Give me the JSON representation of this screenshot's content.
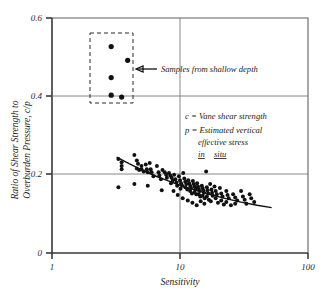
{
  "chart_data": {
    "type": "scatter",
    "title": "",
    "xlabel": "Sensitivity",
    "ylabel": "Ratio of Shear Strength to Overburden Pressure, c/p",
    "xscale": "log",
    "yscale": "linear",
    "xlim": [
      1,
      100
    ],
    "ylim": [
      0,
      0.6
    ],
    "xticks": [
      1,
      10,
      100
    ],
    "xtick_labels": [
      "1",
      "10",
      "100"
    ],
    "yticks": [
      0,
      0.2,
      0.4,
      0.6
    ],
    "ytick_labels": [
      "0",
      "0.2",
      "0.4",
      "0.6"
    ],
    "grid": "gridlines at y=0.2, y=0.4 and x=10",
    "legend": "none",
    "series": [
      {
        "name": "Samples from shallow depth",
        "marker": "filled-circle",
        "points": [
          [
            2.9,
            0.527
          ],
          [
            3.9,
            0.492
          ],
          [
            2.9,
            0.448
          ],
          [
            2.9,
            0.403
          ],
          [
            3.5,
            0.398
          ]
        ]
      },
      {
        "name": "Main data",
        "marker": "filled-circle",
        "points": [
          [
            3.3,
            0.24
          ],
          [
            3.5,
            0.232
          ],
          [
            3.5,
            0.222
          ],
          [
            3.5,
            0.214
          ],
          [
            3.3,
            0.168
          ],
          [
            4.4,
            0.25
          ],
          [
            4.6,
            0.236
          ],
          [
            4.7,
            0.228
          ],
          [
            4.6,
            0.216
          ],
          [
            4.8,
            0.212
          ],
          [
            5.0,
            0.222
          ],
          [
            5.0,
            0.214
          ],
          [
            5.2,
            0.208
          ],
          [
            4.4,
            0.176
          ],
          [
            5.4,
            0.226
          ],
          [
            5.5,
            0.214
          ],
          [
            5.6,
            0.206
          ],
          [
            5.8,
            0.23
          ],
          [
            5.9,
            0.214
          ],
          [
            6.0,
            0.206
          ],
          [
            6.2,
            0.196
          ],
          [
            5.6,
            0.172
          ],
          [
            6.6,
            0.222
          ],
          [
            6.8,
            0.206
          ],
          [
            6.9,
            0.198
          ],
          [
            7.1,
            0.188
          ],
          [
            7.3,
            0.212
          ],
          [
            7.6,
            0.206
          ],
          [
            7.8,
            0.2
          ],
          [
            7.9,
            0.192
          ],
          [
            7.2,
            0.16
          ],
          [
            8.2,
            0.204
          ],
          [
            8.4,
            0.198
          ],
          [
            8.6,
            0.192
          ],
          [
            8.5,
            0.178
          ],
          [
            8.8,
            0.186
          ],
          [
            9.0,
            0.2
          ],
          [
            9.2,
            0.188
          ],
          [
            9.4,
            0.18
          ],
          [
            9.5,
            0.172
          ],
          [
            8.9,
            0.158
          ],
          [
            9.8,
            0.196
          ],
          [
            10.0,
            0.186
          ],
          [
            10.2,
            0.178
          ],
          [
            10.4,
            0.172
          ],
          [
            10.1,
            0.164
          ],
          [
            10.6,
            0.204
          ],
          [
            10.8,
            0.19
          ],
          [
            11.0,
            0.182
          ],
          [
            11.2,
            0.176
          ],
          [
            11.0,
            0.168
          ],
          [
            11.4,
            0.162
          ],
          [
            11.6,
            0.186
          ],
          [
            11.8,
            0.178
          ],
          [
            12.0,
            0.172
          ],
          [
            12.2,
            0.166
          ],
          [
            12.0,
            0.158
          ],
          [
            12.4,
            0.152
          ],
          [
            12.6,
            0.184
          ],
          [
            12.8,
            0.176
          ],
          [
            13.0,
            0.17
          ],
          [
            13.2,
            0.164
          ],
          [
            13.0,
            0.156
          ],
          [
            13.4,
            0.15
          ],
          [
            13.6,
            0.178
          ],
          [
            13.8,
            0.17
          ],
          [
            14.0,
            0.164
          ],
          [
            14.2,
            0.158
          ],
          [
            14.0,
            0.15
          ],
          [
            14.4,
            0.144
          ],
          [
            14.8,
            0.172
          ],
          [
            15.0,
            0.166
          ],
          [
            15.2,
            0.16
          ],
          [
            15.4,
            0.154
          ],
          [
            15.0,
            0.146
          ],
          [
            15.6,
            0.14
          ],
          [
            16.0,
            0.208
          ],
          [
            16.2,
            0.168
          ],
          [
            16.4,
            0.16
          ],
          [
            16.6,
            0.152
          ],
          [
            16.2,
            0.144
          ],
          [
            16.8,
            0.136
          ],
          [
            17.2,
            0.176
          ],
          [
            17.6,
            0.162
          ],
          [
            17.8,
            0.154
          ],
          [
            18.0,
            0.146
          ],
          [
            17.4,
            0.132
          ],
          [
            18.6,
            0.17
          ],
          [
            19.0,
            0.158
          ],
          [
            19.4,
            0.15
          ],
          [
            19.0,
            0.14
          ],
          [
            19.8,
            0.128
          ],
          [
            20.5,
            0.166
          ],
          [
            21.0,
            0.152
          ],
          [
            21.5,
            0.144
          ],
          [
            21.0,
            0.134
          ],
          [
            22.0,
            0.124
          ],
          [
            23.0,
            0.158
          ],
          [
            23.5,
            0.148
          ],
          [
            24.0,
            0.14
          ],
          [
            23.0,
            0.13
          ],
          [
            25.0,
            0.122
          ],
          [
            26.0,
            0.15
          ],
          [
            27.0,
            0.142
          ],
          [
            28.0,
            0.134
          ],
          [
            27.0,
            0.126
          ],
          [
            30.0,
            0.158
          ],
          [
            31.0,
            0.144
          ],
          [
            32.0,
            0.136
          ],
          [
            33.0,
            0.126
          ],
          [
            35.0,
            0.15
          ],
          [
            36.0,
            0.14
          ],
          [
            38.0,
            0.13
          ],
          [
            12.5,
            0.128
          ],
          [
            13.5,
            0.122
          ],
          [
            15.5,
            0.126
          ],
          [
            11.5,
            0.134
          ],
          [
            14.5,
            0.132
          ],
          [
            10.5,
            0.14
          ],
          [
            9.6,
            0.148
          ]
        ]
      }
    ],
    "trend_line": {
      "name": "fitted average curve",
      "points": [
        [
          3.2,
          0.245
        ],
        [
          4.0,
          0.228
        ],
        [
          5.0,
          0.212
        ],
        [
          6.5,
          0.196
        ],
        [
          8.0,
          0.185
        ],
        [
          10.0,
          0.173
        ],
        [
          13.0,
          0.161
        ],
        [
          17.0,
          0.15
        ],
        [
          22.0,
          0.14
        ],
        [
          30.0,
          0.13
        ],
        [
          40.0,
          0.122
        ],
        [
          52.0,
          0.116
        ]
      ]
    },
    "annotations": [
      {
        "name": "shallow-depth-callout",
        "text": "Samples from shallow depth",
        "arrow": "left"
      },
      {
        "name": "symbol-key",
        "lines": [
          "c = Vane shear strength",
          "p = Estimated vertical",
          "effective stress",
          "in  situ"
        ],
        "underlined_last": true
      }
    ],
    "boxes": [
      {
        "name": "shallow-depth-box",
        "style": "dashed",
        "x_range": [
          2.4,
          4.8
        ],
        "y_range": [
          0.383,
          0.548
        ]
      }
    ]
  },
  "axes": {
    "y_title": "Ratio of Shear Strength to",
    "y_title_2": "Overburden Pressure, c/p",
    "x_title": "Sensitivity",
    "y_tick_0": "0",
    "y_tick_02": "0.2",
    "y_tick_04": "0.4",
    "y_tick_06": "0.6",
    "x_tick_1": "1",
    "x_tick_10": "10",
    "x_tick_100": "100"
  },
  "notes": {
    "callout": "Samples from shallow depth",
    "key_c": "c = Vane shear strength",
    "key_p": "p = Estimated vertical",
    "key_p2": "effective stress",
    "key_p3": "in",
    "key_p4": "situ"
  }
}
